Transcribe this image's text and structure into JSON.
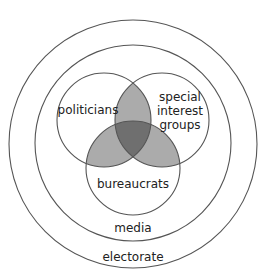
{
  "diagram": {
    "type": "nested-venn",
    "colors": {
      "background": "#ffffff",
      "stroke": "#555555",
      "pair_overlap": "#ababab",
      "triple_overlap": "#6f6f6f",
      "text": "#222222"
    },
    "outer_rings": [
      {
        "label": "electorate"
      },
      {
        "label": "media"
      }
    ],
    "sets": [
      {
        "label_lines": [
          "politicians"
        ]
      },
      {
        "label_lines": [
          "special",
          "interest",
          "groups"
        ]
      },
      {
        "label_lines": [
          "bureaucrats"
        ]
      }
    ]
  }
}
